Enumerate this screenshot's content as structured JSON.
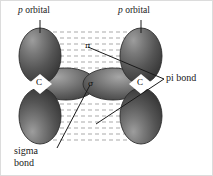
{
  "figure": {
    "type": "orbital-diagram",
    "labels": {
      "p_orbital_left": {
        "italic_part": "p",
        "rest": " orbital"
      },
      "p_orbital_right": {
        "italic_part": "p",
        "rest": " orbital"
      },
      "pi_bond": "pi bond",
      "sigma_bond_line1": "sigma",
      "sigma_bond_line2": "bond",
      "carbon_left": "C",
      "carbon_right": "C",
      "pi_symbol_top": "π",
      "sigma_symbol_center": "σ"
    },
    "colors": {
      "orbital_dark": "#3c3c3c",
      "orbital_mid": "#5a5a5a",
      "orbital_light": "#8e8e8e",
      "orbital_highlight": "#b4b4b4",
      "outline": "#2b2b2b",
      "dashed_line": "#a8a8a8",
      "leader_line": "#1a1a1a",
      "text": "#1a1a1a",
      "border": "#d8d8d8",
      "background": "#ffffff"
    },
    "elements": {
      "p_orbitals_count": 4,
      "sigma_lobes_count": 2,
      "dashed_band_rows_top": 7,
      "dashed_band_rows_bottom": 7
    }
  }
}
